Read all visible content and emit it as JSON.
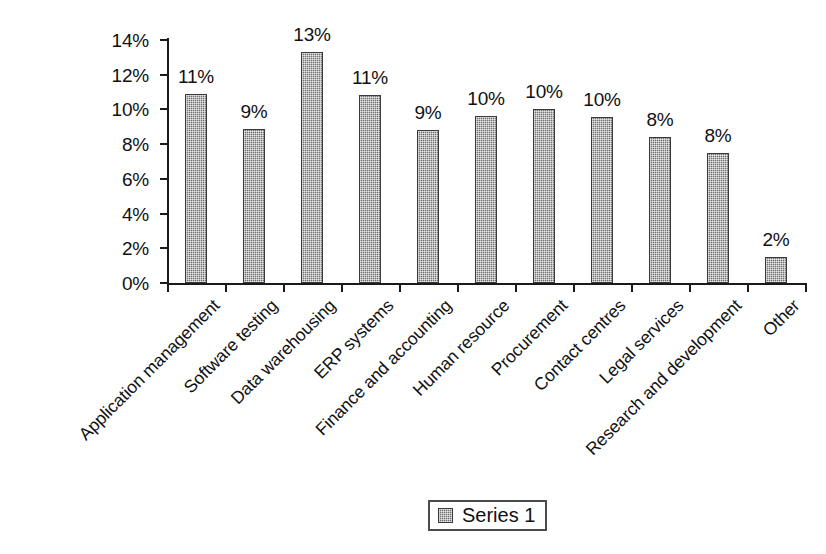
{
  "chart_data": {
    "type": "bar",
    "title": "",
    "subtitle": "",
    "xlabel": "",
    "ylabel": "",
    "ylim": [
      0,
      14
    ],
    "ytick_labels": [
      "0%",
      "2%",
      "4%",
      "6%",
      "8%",
      "10%",
      "12%",
      "14%"
    ],
    "ytick_values": [
      0,
      2,
      4,
      6,
      8,
      10,
      12,
      14
    ],
    "grid": false,
    "legend_position": "bottom-center",
    "categories": [
      "Application management",
      "Software testing",
      "Data warehousing",
      "ERP systems",
      "Finance and accounting",
      "Human resource",
      "Procurement",
      "Contact centres",
      "Legal services",
      "Research and development",
      "Other"
    ],
    "series": [
      {
        "name": "Series 1",
        "values": [
          10.9,
          8.9,
          13.3,
          10.85,
          8.8,
          9.6,
          10.0,
          9.55,
          8.4,
          7.5,
          1.5
        ],
        "data_labels": [
          "11%",
          "9%",
          "13%",
          "11%",
          "9%",
          "10%",
          "10%",
          "10%",
          "8%",
          "8%",
          "2%"
        ],
        "color": "#6e6e6e",
        "pattern": "fine-checker-stipple"
      }
    ]
  },
  "legend": {
    "items": [
      {
        "label": "Series 1",
        "swatch_name": "series-1-swatch"
      }
    ]
  },
  "colors": {
    "bar_fill": "#6e6e6e",
    "bar_stroke": "#3a3a3a",
    "axis": "#1a1a1a",
    "text": "#111111",
    "background": "#ffffff"
  }
}
